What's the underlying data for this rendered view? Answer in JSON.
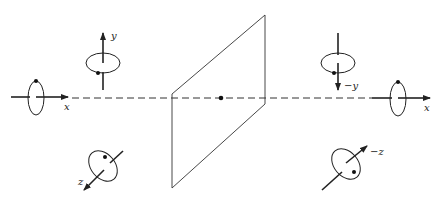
{
  "diagram": {
    "colors": {
      "stroke": "#222222",
      "background": "#ffffff"
    },
    "left_side": {
      "x_axis_label": "x",
      "y_axis_label": "y",
      "z_axis_label": "z"
    },
    "right_side": {
      "x_axis_label": "x",
      "y_axis_label": "−y",
      "z_axis_label": "−z"
    },
    "plane": {
      "name": "mirror-plane",
      "center_point": "inversion-center"
    }
  }
}
